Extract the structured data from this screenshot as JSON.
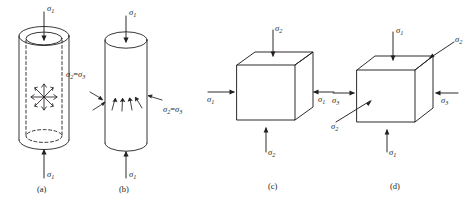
{
  "figure": {
    "name": "stress-state-diagram",
    "background": "#ffffff",
    "stroke_color": "#231f20",
    "panel_count": 4
  },
  "panels": [
    {
      "id": "a",
      "caption": "(a)",
      "shape": "hollow-cylinder",
      "description": "Hollow thick-walled cylinder with dashed internal outline and radial burst of outward arrows at mid-height",
      "labels": [
        {
          "name": "sigma-1-top",
          "sub": "1",
          "text": "σ"
        },
        {
          "name": "sigma-1-bottom",
          "sub": "1",
          "text": "σ"
        },
        {
          "name": "sigma-2-equals-sigma-3",
          "text": "σ",
          "sub": "2",
          "eq": "=",
          "text2": "σ",
          "sub2": "3"
        }
      ],
      "arrows": [
        {
          "name": "sigma-1-top-arrow",
          "direction": "down"
        },
        {
          "name": "sigma-1-bottom-arrow",
          "direction": "up"
        },
        {
          "name": "internal-radial-burst",
          "direction": "outward",
          "count": 8
        }
      ]
    },
    {
      "id": "b",
      "caption": "(b)",
      "shape": "solid-cylinder",
      "description": "Solid cylinder with external converging arrows pointing inward toward the mid-height surface",
      "labels": [
        {
          "name": "sigma-1-top",
          "sub": "1",
          "text": "σ"
        },
        {
          "name": "sigma-1-bottom",
          "sub": "1",
          "text": "σ"
        },
        {
          "name": "sigma-2-equals-sigma-3",
          "text": "σ",
          "sub": "2",
          "eq": "=",
          "text2": "σ",
          "sub2": "3"
        }
      ],
      "arrows": [
        {
          "name": "sigma-1-top-arrow",
          "direction": "down"
        },
        {
          "name": "sigma-1-bottom-arrow",
          "direction": "up"
        },
        {
          "name": "confining-pressure-arrows",
          "direction": "inward",
          "count": 7
        }
      ]
    },
    {
      "id": "c",
      "caption": "(c)",
      "shape": "cube",
      "description": "Cube in isometric view loaded biaxially: sigma-2 vertical, sigma-1 horizontal",
      "labels": [
        {
          "name": "sigma-2-top",
          "sub": "2",
          "text": "σ"
        },
        {
          "name": "sigma-2-bottom",
          "sub": "2",
          "text": "σ"
        },
        {
          "name": "sigma-1-left",
          "sub": "1",
          "text": "σ"
        },
        {
          "name": "sigma-1-right",
          "sub": "1",
          "text": "σ"
        }
      ],
      "arrows": [
        {
          "name": "sigma-2-top-arrow",
          "direction": "down"
        },
        {
          "name": "sigma-2-bottom-arrow",
          "direction": "up"
        },
        {
          "name": "sigma-1-left-arrow",
          "direction": "right"
        },
        {
          "name": "sigma-1-right-arrow",
          "direction": "left"
        }
      ]
    },
    {
      "id": "d",
      "caption": "(d)",
      "shape": "cube",
      "description": "Cube in isometric view loaded triaxially: sigma-1 vertical, sigma-3 horizontal, sigma-2 along depth axis",
      "labels": [
        {
          "name": "sigma-1-top",
          "sub": "1",
          "text": "σ"
        },
        {
          "name": "sigma-1-bottom",
          "sub": "1",
          "text": "σ"
        },
        {
          "name": "sigma-3-left",
          "sub": "3",
          "text": "σ"
        },
        {
          "name": "sigma-3-right",
          "sub": "3",
          "text": "σ"
        },
        {
          "name": "sigma-2-upper-right",
          "sub": "2",
          "text": "σ"
        },
        {
          "name": "sigma-2-lower-left",
          "sub": "2",
          "text": "σ"
        }
      ],
      "arrows": [
        {
          "name": "sigma-1-top-arrow",
          "direction": "down"
        },
        {
          "name": "sigma-1-bottom-arrow",
          "direction": "up"
        },
        {
          "name": "sigma-3-left-arrow",
          "direction": "right"
        },
        {
          "name": "sigma-3-right-arrow",
          "direction": "left"
        },
        {
          "name": "sigma-2-upper-right-arrow",
          "direction": "down-left"
        },
        {
          "name": "sigma-2-lower-left-arrow",
          "direction": "up-right"
        }
      ]
    }
  ],
  "text": {
    "sigma": "σ",
    "equals": "=",
    "sub_1": "1",
    "sub_2": "2",
    "sub_3": "3",
    "caption_a": "(a)",
    "caption_b": "(b)",
    "caption_c": "(c)",
    "caption_d": "(d)"
  }
}
